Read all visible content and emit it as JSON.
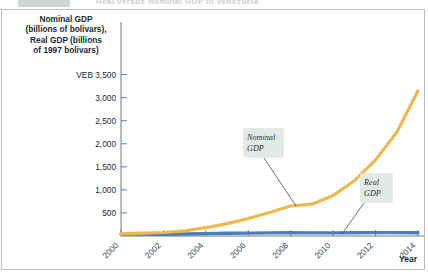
{
  "page": {
    "strip_caption": "Real versus Nominal GDP in Venezuela"
  },
  "colors": {
    "nominal": "#efb84e",
    "real": "#4a7ebb",
    "axis": "#6d7c85",
    "text": "#1b2a33",
    "callout_bg": "#e3eae6",
    "frame": "#b9bfbc"
  },
  "axis": {
    "y_title": "Nominal GDP\n(billions of bolivars),\nReal GDP (billions\nof 1997 bolivars)",
    "y_unit_prefix": "VEB",
    "x_title": "Year"
  },
  "annotations": [
    {
      "name": "nominal-gdp-callout",
      "line1": "Nominal",
      "line2": "GDP"
    },
    {
      "name": "real-gdp-callout",
      "line1": "Real",
      "line2": "GDP"
    }
  ],
  "chart_data": {
    "type": "line",
    "title": "Real versus Nominal GDP in Venezuela",
    "xlabel": "Year",
    "ylabel": "Nominal GDP (billions of bolivars), Real GDP (billions of 1997 bolivars)",
    "xlim": [
      2000,
      2014
    ],
    "ylim": [
      0,
      3600
    ],
    "ytick_labels": [
      "VEB 3,500",
      "3,000",
      "2,500",
      "2,000",
      "1,500",
      "1,000",
      "500"
    ],
    "yticks": [
      3500,
      3000,
      2500,
      2000,
      1500,
      1000,
      500
    ],
    "xticks": [
      2000,
      2001,
      2002,
      2003,
      2004,
      2005,
      2006,
      2007,
      2008,
      2009,
      2010,
      2011,
      2012,
      2013,
      2014
    ],
    "xtick_labels": [
      "2000",
      "2002",
      "2004",
      "2006",
      "2008",
      "2010",
      "2012",
      "2014"
    ],
    "xtick_labels_values": [
      2000,
      2002,
      2004,
      2006,
      2008,
      2010,
      2012,
      2014
    ],
    "grid": false,
    "legend": "annotated-callouts",
    "x": [
      2000,
      2001,
      2002,
      2003,
      2004,
      2005,
      2006,
      2007,
      2008,
      2009,
      2010,
      2011,
      2012,
      2013,
      2014
    ],
    "series": [
      {
        "name": "Nominal GDP",
        "color": "#efb84e",
        "values": [
          50,
          60,
          75,
          110,
          180,
          270,
          380,
          510,
          650,
          690,
          880,
          1200,
          1650,
          2250,
          3150
        ]
      },
      {
        "name": "Real GDP",
        "color": "#4a7ebb",
        "values": [
          45,
          43,
          40,
          44,
          52,
          58,
          63,
          68,
          71,
          68,
          67,
          70,
          73,
          74,
          72
        ]
      }
    ]
  }
}
